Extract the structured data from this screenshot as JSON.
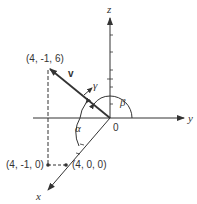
{
  "diagram": {
    "axes": {
      "x_label": "x",
      "y_label": "y",
      "z_label": "z",
      "origin_label": "0"
    },
    "vector": {
      "label": "v",
      "tip_point": "(4, -1, 6)"
    },
    "points": [
      {
        "label": "(4, -1, 6)"
      },
      {
        "label": "(4, -1, 0)"
      },
      {
        "label": "(4, 0, 0)"
      }
    ],
    "angles": {
      "alpha": "α",
      "beta": "β",
      "gamma": "γ"
    },
    "colors": {
      "line": "#333333",
      "background": "#ffffff"
    }
  }
}
